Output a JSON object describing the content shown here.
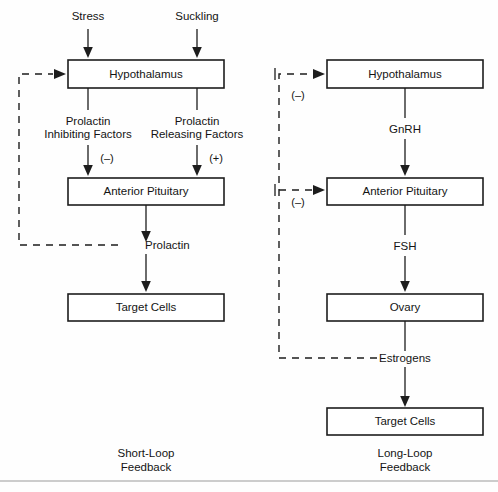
{
  "figure": {
    "width": 498,
    "height": 492,
    "background_color": "#fefefe",
    "line_color": "#1d1d1d",
    "text_color": "#141414",
    "footer_rule_color": "#9a9a9a"
  },
  "short_loop": {
    "caption_line1": "Short-Loop",
    "caption_line2": "Feedback",
    "inputs": [
      {
        "label": "Stress"
      },
      {
        "label": "Suckling"
      }
    ],
    "boxes": [
      {
        "label": "Hypothalamus"
      },
      {
        "label": "Anterior Pituitary"
      },
      {
        "label": "Target Cells"
      }
    ],
    "mediators": [
      {
        "line1": "Prolactin",
        "line2": "Inhibiting Factors",
        "sign": "(–)"
      },
      {
        "line1": "Prolactin",
        "line2": "Releasing Factors",
        "sign": "(+)"
      }
    ],
    "hormone": "Prolactin",
    "feedback_signs": []
  },
  "long_loop": {
    "caption_line1": "Long-Loop",
    "caption_line2": "Feedback",
    "boxes": [
      {
        "label": "Hypothalamus"
      },
      {
        "label": "Anterior Pituitary"
      },
      {
        "label": "Ovary"
      },
      {
        "label": "Target Cells"
      }
    ],
    "mediators": [
      {
        "label": "GnRH"
      },
      {
        "label": "FSH"
      }
    ],
    "hormone": "Estrogens",
    "feedback_signs": [
      {
        "sign": "(–)"
      },
      {
        "sign": "(–)"
      }
    ]
  }
}
